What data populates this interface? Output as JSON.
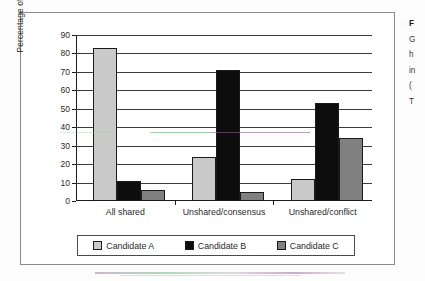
{
  "figure": {
    "caption_lines": [
      "F",
      "G",
      "h",
      "in",
      "(",
      "T"
    ]
  },
  "chart_data": {
    "type": "bar",
    "title": "",
    "xlabel": "",
    "ylabel": "Percentage of groups",
    "categories": [
      "All shared",
      "Unshared/consensus",
      "Unshared/conflict"
    ],
    "series": [
      {
        "name": "Candidate A",
        "color": "#c9c9c9",
        "values": [
          83,
          24,
          12
        ]
      },
      {
        "name": "Candidate B",
        "color": "#0d0d0d",
        "values": [
          11,
          71,
          53
        ]
      },
      {
        "name": "Candidate C",
        "color": "#808080",
        "values": [
          6,
          5,
          34
        ]
      }
    ],
    "ylim": [
      0,
      90
    ],
    "ytick_labels": [
      "0",
      "10",
      "20",
      "30",
      "40",
      "50",
      "60",
      "70",
      "80",
      "90"
    ],
    "ytick_values": [
      0,
      10,
      20,
      30,
      40,
      50,
      60,
      70,
      80,
      90
    ],
    "grid": true,
    "legend_position": "bottom"
  }
}
